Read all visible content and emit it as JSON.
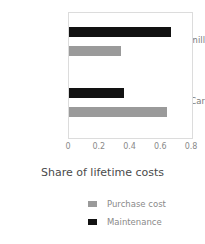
{
  "chart_data": {
    "type": "bar",
    "orientation": "horizontal",
    "title": "",
    "xlabel": "Share of lifetime costs",
    "ylabel": "",
    "categories": [
      "Rolling mill",
      "Car"
    ],
    "series": [
      {
        "name": "Purchase cost",
        "color": "#9a9a9a",
        "values": [
          0.335,
          0.64
        ]
      },
      {
        "name": "Maintenance",
        "color": "#121212",
        "values": [
          0.665,
          0.355
        ]
      }
    ],
    "xlim": [
      0,
      0.8
    ],
    "xticks": [
      0,
      0.2,
      0.4,
      0.6,
      0.8
    ],
    "xtick_labels": [
      "0",
      "0.2",
      "0.4",
      "0.6",
      "0.8"
    ],
    "grid": false,
    "legend_position": "bottom"
  },
  "legend": {
    "items": [
      {
        "label": "Purchase cost",
        "color": "#9a9a9a"
      },
      {
        "label": "Maintenance",
        "color": "#121212"
      }
    ]
  }
}
